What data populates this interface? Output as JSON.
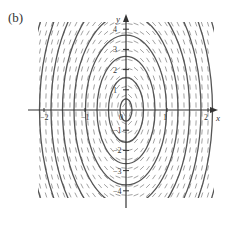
{
  "figure": {
    "panel_label": "(b)",
    "x_axis_label": "x",
    "y_axis_label": "y",
    "x_ticks": [
      {
        "value": -2,
        "label": "−2"
      },
      {
        "value": -1,
        "label": "−1"
      },
      {
        "value": 0,
        "label": "0"
      },
      {
        "value": 1,
        "label": "1"
      },
      {
        "value": 2,
        "label": "2"
      }
    ],
    "y_ticks": [
      {
        "value": 4,
        "label": "4"
      },
      {
        "value": 3,
        "label": "3"
      },
      {
        "value": 2,
        "label": "2"
      },
      {
        "value": 1,
        "label": "1"
      },
      {
        "value": -1,
        "label": "−1"
      },
      {
        "value": -2,
        "label": "−2"
      },
      {
        "value": -3,
        "label": "−3"
      },
      {
        "value": -4,
        "label": "−4"
      }
    ],
    "colors": {
      "axis": "#333333",
      "curve": "#555555",
      "slope_mark": "#8a8a8a"
    }
  }
}
